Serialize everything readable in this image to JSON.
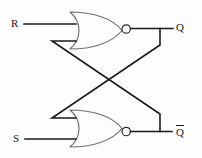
{
  "diagram": {
    "type": "logic-circuit-schematic",
    "canvas": {
      "width": 202,
      "height": 158,
      "background": "#fdfdfd"
    },
    "colors": {
      "wire": "#1a1a1a",
      "gate_outline": "#6f6f6f",
      "bubble_fill": "#ffffff",
      "label": "#1a1a1a",
      "background": "#fdfdfd"
    },
    "inputs": [
      {
        "id": "input-r",
        "label": "R",
        "x": 14,
        "y": 25,
        "wire_y": 24,
        "wire_from_x": 24,
        "wire_to_x": 70
      },
      {
        "id": "input-s",
        "label": "S",
        "x": 16,
        "y": 140,
        "wire_y": 139,
        "wire_from_x": 25,
        "wire_to_x": 70
      }
    ],
    "outputs": [
      {
        "id": "output-q",
        "label": "Q",
        "has_overline": false,
        "x": 178,
        "y": 29,
        "wire_y": 28,
        "wire_from_x": 131,
        "wire_to_x": 173
      },
      {
        "id": "output-qbar",
        "label": "Q",
        "has_overline": true,
        "x": 178,
        "y": 133,
        "wire_y": 131,
        "wire_from_x": 131,
        "wire_to_x": 172
      }
    ],
    "gates": [
      {
        "id": "nor-gate-top",
        "type": "NOR",
        "label": "NOR",
        "back_x": 70,
        "top_y": 12,
        "bottom_y": 49,
        "nose_x": 122,
        "bubble_cx": 126,
        "bubble_cy": 28,
        "bubble_r": 4.2,
        "input_pins": [
          24,
          41
        ],
        "output_pin_y": 28
      },
      {
        "id": "nor-gate-bottom",
        "type": "NOR",
        "label": "NOR",
        "back_x": 70,
        "top_y": 109,
        "bottom_y": 147,
        "nose_x": 122,
        "bubble_cx": 126,
        "bubble_cy": 131,
        "bubble_r": 4.2,
        "input_pins": [
          118,
          139
        ],
        "output_pin_y": 131
      }
    ],
    "feedback_paths": [
      {
        "id": "feedback-q-to-bottom-gate",
        "from": "output-q",
        "to": "nor-gate-bottom.input.0",
        "description": "Q output taps down and crosses diagonally to the upper input of the bottom NOR gate",
        "points": "160,28 160,45 52,118 70,118"
      },
      {
        "id": "feedback-qbar-to-top-gate",
        "from": "output-qbar",
        "to": "nor-gate-top.input.1",
        "description": "Q-bar output taps up and crosses diagonally to the lower input of the top NOR gate",
        "points": "160,131 160,114 52,41 70,41"
      }
    ],
    "crossing_point": {
      "x": 106,
      "y": 79
    }
  }
}
